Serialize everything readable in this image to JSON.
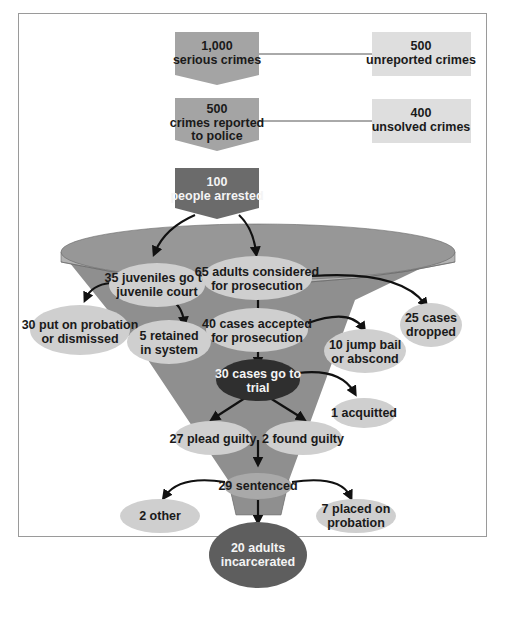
{
  "colors": {
    "mid_gray": "#a4a4a4",
    "light_gray": "#dedede",
    "dark_box": "#6b6b6b",
    "funnel": "#8f8f8f",
    "funnel_rim": "#b3b3b3",
    "oval": "#cfcfcf",
    "dark_oval": "#2f2f2f",
    "incarcerated": "#5e5e5e"
  },
  "top_flow": [
    {
      "line1": "1,000",
      "line2": "serious crimes",
      "line3": ""
    },
    {
      "line1": "500",
      "line2": "crimes reported",
      "line3": "to police"
    },
    {
      "line1": "100",
      "line2": "people arrested",
      "line3": ""
    }
  ],
  "side_boxes": [
    {
      "line1": "500",
      "line2": "unreported crimes"
    },
    {
      "line1": "400",
      "line2": "unsolved crimes"
    }
  ],
  "nodes": {
    "juveniles": {
      "line1": "35 juveniles go to",
      "line2": "juvenile court"
    },
    "adults": {
      "line1": "65 adults considered",
      "line2": "for prosecution"
    },
    "probation_dismissed": {
      "line1": "30 put on probation",
      "line2": "or dismissed"
    },
    "retained": {
      "line1": "5 retained",
      "line2": "in system"
    },
    "accepted": {
      "line1": "40 cases accepted",
      "line2": "for prosecution"
    },
    "dropped": {
      "line1": "25 cases",
      "line2": "dropped"
    },
    "jump_bail": {
      "line1": "10 jump bail",
      "line2": "or abscond"
    },
    "trial": {
      "line1": "30 cases go to",
      "line2": "trial"
    },
    "acquitted": {
      "line1": "1 acquitted"
    },
    "plead_guilty": {
      "line1": "27 plead guilty"
    },
    "found_guilty": {
      "line1": "2 found guilty"
    },
    "sentenced": {
      "line1": "29 sentenced"
    },
    "other": {
      "line1": "2 other"
    },
    "placed_probation": {
      "line1": "7 placed on",
      "line2": "probation"
    },
    "incarcerated": {
      "line1": "20 adults",
      "line2": "incarcerated"
    }
  }
}
